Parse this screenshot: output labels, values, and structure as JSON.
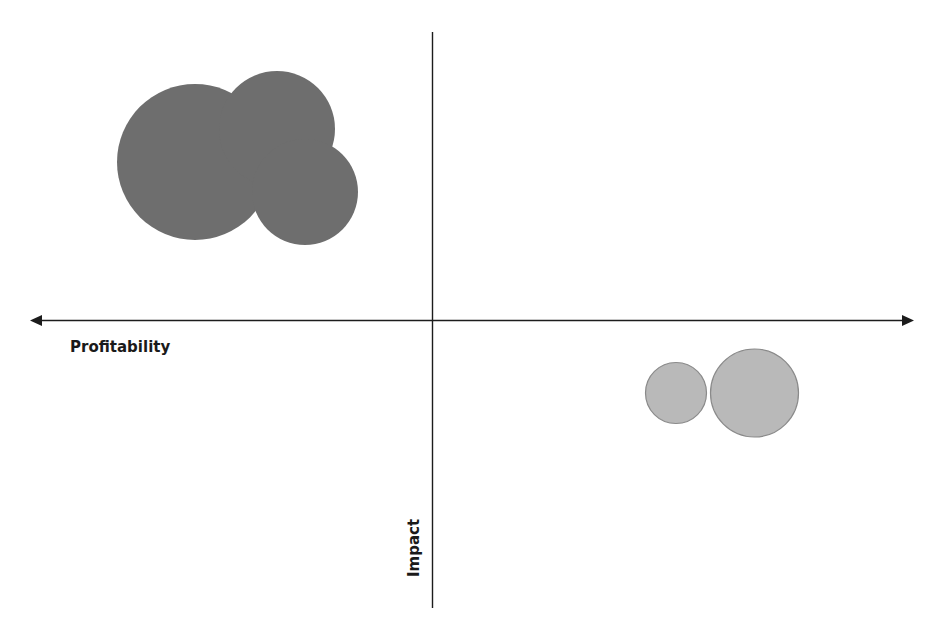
{
  "diagram": {
    "type": "quadrant-bubble-chart",
    "axes": {
      "horizontal": {
        "label": "Profitability",
        "arrows": [
          "left",
          "right"
        ]
      },
      "vertical": {
        "label": "Impact",
        "arrows": []
      }
    },
    "colors": {
      "dark_bubble": "#6e6e6e",
      "light_bubble": "#b9b9b9",
      "light_bubble_outline": "#8a8a8a",
      "axis": "#1c1c1c"
    },
    "bubble_groups": [
      {
        "name": "upper-left-group",
        "quadrant": "top-left",
        "style": "dark",
        "bubbles": [
          {
            "name": "bubble-large",
            "size": "large"
          },
          {
            "name": "bubble-medium",
            "size": "medium"
          },
          {
            "name": "bubble-small",
            "size": "small"
          }
        ]
      },
      {
        "name": "lower-right-group",
        "quadrant": "bottom-right",
        "style": "light",
        "bubbles": [
          {
            "name": "bubble-small",
            "size": "small"
          },
          {
            "name": "bubble-medium",
            "size": "medium"
          }
        ]
      }
    ]
  }
}
